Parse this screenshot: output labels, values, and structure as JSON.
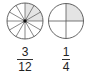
{
  "diagram": {
    "colors": {
      "stroke": "#555555",
      "shade": "#e4e4e4",
      "center_dot": "#111111"
    },
    "circles": [
      {
        "name": "twelfths-circle",
        "slices": 12,
        "shaded": 3,
        "fraction": {
          "numerator": "3",
          "denominator": "12"
        }
      },
      {
        "name": "quarters-circle",
        "slices": 4,
        "shaded": 1,
        "fraction": {
          "numerator": "1",
          "denominator": "4"
        }
      }
    ]
  }
}
